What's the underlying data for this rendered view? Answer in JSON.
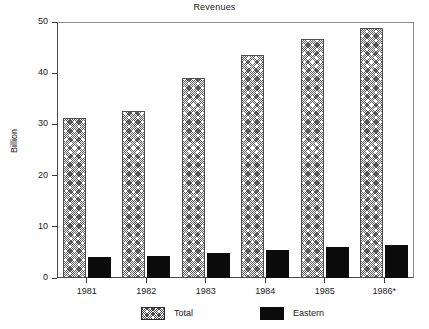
{
  "chart_data": {
    "type": "bar",
    "title": "Revenues",
    "xlabel": "",
    "ylabel": "Billion",
    "categories": [
      "1981",
      "1982",
      "1983",
      "1984",
      "1985",
      "1986*"
    ],
    "series": [
      {
        "name": "Total",
        "values": [
          31.2,
          32.6,
          39.1,
          43.6,
          46.6,
          48.9
        ],
        "pattern": "hatched",
        "color": "#ffffff"
      },
      {
        "name": "Eastern",
        "values": [
          4.1,
          4.3,
          4.9,
          5.5,
          6.1,
          6.5
        ],
        "pattern": "solid",
        "color": "#0b0b0b"
      }
    ],
    "ylim": [
      0,
      50
    ],
    "yticks": [
      0,
      10,
      20,
      30,
      40,
      50
    ],
    "ytick_labels": [
      "0",
      "10",
      "20",
      "30",
      "40",
      "50"
    ],
    "grid": false,
    "legend_position": "bottom",
    "legend_entries": [
      "Total",
      "Eastern"
    ],
    "annotations": []
  },
  "axes": {
    "frame_color": "#4a4a4a"
  }
}
